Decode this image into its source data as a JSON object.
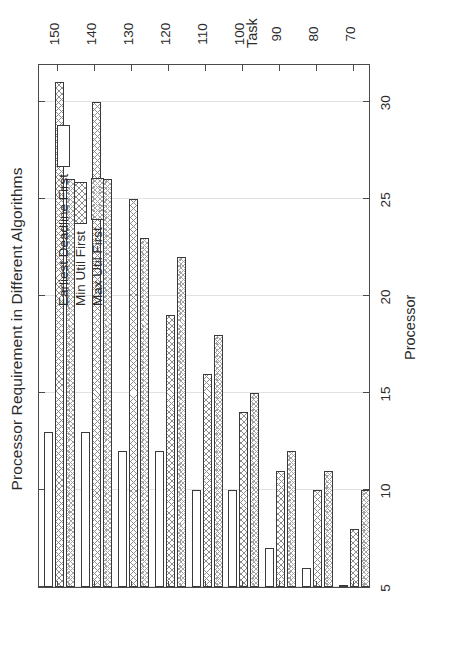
{
  "chart_data": {
    "type": "bar",
    "orientation": "horizontal-rotated",
    "title": "Processor Requirement in Different Algorithms",
    "xlabel": "Task",
    "ylabel": "Processor",
    "categories": [
      70,
      80,
      90,
      100,
      110,
      120,
      130,
      140,
      150
    ],
    "xtick_labels": [
      "70",
      "80",
      "90",
      "100",
      "110",
      "120",
      "130",
      "140",
      "150"
    ],
    "ytick_labels": [
      "5",
      "10",
      "15",
      "20",
      "25",
      "30"
    ],
    "yticks": [
      5,
      10,
      15,
      20,
      25,
      30
    ],
    "ylim": [
      5,
      32
    ],
    "xlim": [
      65,
      155
    ],
    "grid": true,
    "legend_position": "upper-left",
    "series": [
      {
        "name": "Earliest Deadline First",
        "fill": "empty",
        "values": [
          5,
          6,
          7,
          10,
          10,
          12,
          12,
          13,
          13
        ]
      },
      {
        "name": "Min Util First",
        "fill": "crosshatch",
        "values": [
          8,
          10,
          11,
          14,
          16,
          19,
          25,
          30,
          31
        ]
      },
      {
        "name": "Max Util First",
        "fill": "dense-dotted-crosshatch",
        "values": [
          10,
          11,
          12,
          15,
          18,
          22,
          23,
          26,
          26
        ]
      }
    ]
  },
  "legend": {
    "entries": [
      {
        "label": "Earliest Deadline First",
        "swatch": "empty-swatch"
      },
      {
        "label": "Min Util First",
        "swatch": "crosshatch-swatch"
      },
      {
        "label": "Max Util First",
        "swatch": "dotted-swatch"
      }
    ]
  },
  "colors": {
    "axis": "#4a4a4a",
    "grid": "#e2e2e2",
    "text": "#2b2b2b",
    "background": "#ffffff"
  }
}
